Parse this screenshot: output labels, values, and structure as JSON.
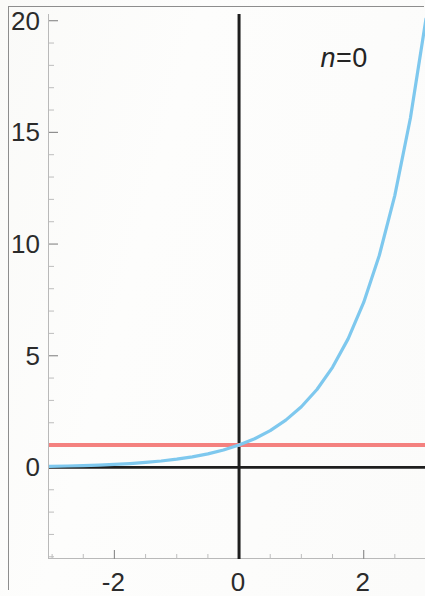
{
  "figure": {
    "annotation": "n=0",
    "annotation_symbol": "n",
    "annotation_rest": "=0",
    "background_color": "#fdfdfc",
    "frame_color": "#8d8d8d"
  },
  "chart_data": {
    "type": "line",
    "title": "",
    "subtitle": "",
    "xlabel": "",
    "ylabel": "",
    "annotation": "n=0",
    "xlim": [
      -3.05,
      3.0
    ],
    "ylim": [
      -4.1,
      20.3
    ],
    "grid": false,
    "legend": "none",
    "x_ticks": [
      -2,
      0,
      2
    ],
    "x_tick_labels": [
      "-2",
      "0",
      "2"
    ],
    "y_ticks": [
      0,
      5,
      10,
      15,
      20
    ],
    "y_tick_labels": [
      "0",
      "5",
      "10",
      "15",
      "20"
    ],
    "x_minor_tick_step": 0.5,
    "y_minor_tick_step": 1,
    "axes_drawn_at_origin": true,
    "series": [
      {
        "name": "exponential",
        "color": "#7ec8ee",
        "linewidth": 3.2,
        "expression": "exp(x)",
        "x": [
          -3.05,
          -2.75,
          -2.5,
          -2.25,
          -2.0,
          -1.75,
          -1.5,
          -1.25,
          -1.0,
          -0.75,
          -0.5,
          -0.25,
          0.0,
          0.25,
          0.5,
          0.75,
          1.0,
          1.25,
          1.5,
          1.75,
          2.0,
          2.25,
          2.5,
          2.75,
          3.0
        ],
        "y": [
          0.047,
          0.064,
          0.082,
          0.105,
          0.135,
          0.174,
          0.223,
          0.287,
          0.368,
          0.472,
          0.607,
          0.779,
          1.0,
          1.284,
          1.649,
          2.117,
          2.718,
          3.49,
          4.482,
          5.755,
          7.389,
          9.488,
          12.182,
          15.643,
          20.086
        ]
      },
      {
        "name": "constant-one",
        "color": "#f4817f",
        "linewidth": 4.0,
        "expression": "1",
        "x": [
          -3.05,
          3.0
        ],
        "y": [
          1.0,
          1.0
        ]
      }
    ],
    "reference_lines": [
      {
        "name": "x-axis",
        "orientation": "horizontal",
        "value": 0,
        "color": "#1e1e1e",
        "linewidth": 2.6
      },
      {
        "name": "y-axis",
        "orientation": "vertical",
        "value": 0,
        "color": "#1e1e1e",
        "linewidth": 3.0
      }
    ]
  },
  "axes": {
    "y_labels": [
      {
        "text": "20",
        "value": 20
      },
      {
        "text": "15",
        "value": 15
      },
      {
        "text": "10",
        "value": 10
      },
      {
        "text": "5",
        "value": 5
      },
      {
        "text": "0",
        "value": 0
      }
    ],
    "x_labels": [
      {
        "text": "-2",
        "value": -2
      },
      {
        "text": "0",
        "value": 0
      },
      {
        "text": "2",
        "value": 2
      }
    ]
  }
}
